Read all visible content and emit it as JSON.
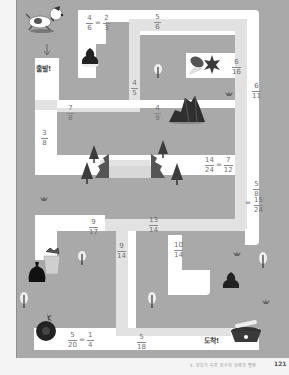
{
  "maze": {
    "start_label": "출발!",
    "end_label": "도착!",
    "colors": {
      "board": "#a9a9a9",
      "path_white": "#ffffff",
      "path_gray": "#e2e2e2",
      "text": "#6f6f6f"
    },
    "fractions": [
      {
        "id": "f1",
        "num": "4",
        "den": "6",
        "eq_num": "2",
        "eq_den": "3"
      },
      {
        "id": "f2",
        "num": "5",
        "den": "6"
      },
      {
        "id": "f3",
        "num": "6",
        "den": "16"
      },
      {
        "id": "f4",
        "num": "4",
        "den": "5"
      },
      {
        "id": "f5",
        "num": "6",
        "den": "11"
      },
      {
        "id": "f6",
        "num": "7",
        "den": "8"
      },
      {
        "id": "f7",
        "num": "4",
        "den": "9"
      },
      {
        "id": "f8",
        "num": "3",
        "den": "8"
      },
      {
        "id": "f9",
        "num": "14",
        "den": "24",
        "eq_num": "7",
        "eq_den": "12"
      },
      {
        "id": "f10",
        "num": "5",
        "den": "8",
        "eq_num": "15",
        "eq_den": "24"
      },
      {
        "id": "f11",
        "num": "9",
        "den": "17"
      },
      {
        "id": "f12",
        "num": "13",
        "den": "14"
      },
      {
        "id": "f13",
        "num": "9",
        "den": "14"
      },
      {
        "id": "f14",
        "num": "10",
        "den": "14"
      },
      {
        "id": "f15",
        "num": "5",
        "den": "20",
        "eq_num": "1",
        "eq_den": "4"
      },
      {
        "id": "f16",
        "num": "5",
        "den": "18"
      }
    ],
    "icons": [
      "dog-icon",
      "poop-icon",
      "leaves-icon",
      "rock-icon",
      "pine-tree-icon",
      "trash-can-icon",
      "garbage-bag-icon",
      "bomb-icon",
      "dog-bowl-icon",
      "tree-icon",
      "star-icon",
      "arrow-down-icon"
    ]
  },
  "footer": {
    "text": "5. 분모가 다른 분수의 덧셈과 뺄셈",
    "page": "121"
  }
}
